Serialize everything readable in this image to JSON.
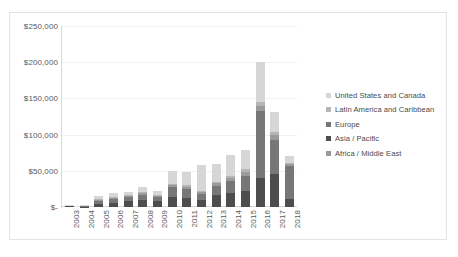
{
  "chart_data": {
    "type": "bar",
    "stacked": true,
    "title": "",
    "xlabel": "",
    "ylabel": "",
    "ylim": [
      0,
      250000
    ],
    "ytick_values": [
      0,
      50000,
      100000,
      150000,
      200000,
      250000
    ],
    "ytick_labels": [
      "$-",
      "$50,000",
      "$100,000",
      "$150,000",
      "$200,000",
      "$250,000"
    ],
    "grid": true,
    "legend_position": "right",
    "categories": [
      "2003",
      "2004",
      "2005",
      "2006",
      "2007",
      "2008",
      "2009",
      "2010",
      "2011",
      "2012",
      "2013",
      "2014",
      "2015",
      "2016",
      "2017",
      "2018"
    ],
    "series": [
      {
        "name": "Asia / Pacific",
        "color": "#4d4d4d",
        "values": [
          1000,
          500,
          4000,
          6000,
          8000,
          9000,
          8000,
          14000,
          13000,
          9000,
          16000,
          19000,
          22000,
          40000,
          46000,
          11000
        ]
      },
      {
        "name": "Europe",
        "color": "#777777",
        "values": [
          600,
          700,
          4000,
          5000,
          5500,
          8000,
          6000,
          13000,
          12000,
          9000,
          13000,
          17000,
          21000,
          92000,
          47000,
          45000
        ]
      },
      {
        "name": "Africa / Middle East",
        "color": "#9a9a9a",
        "values": [
          300,
          400,
          1500,
          1800,
          1500,
          2000,
          1500,
          3500,
          3000,
          2500,
          3500,
          4500,
          5500,
          8000,
          6000,
          3000
        ]
      },
      {
        "name": "Latin America and Caribbean",
        "color": "#b5b5b5",
        "values": [
          200,
          300,
          1000,
          1200,
          1000,
          1200,
          1000,
          2000,
          2000,
          2000,
          2500,
          3000,
          3500,
          5000,
          4000,
          2000
        ]
      },
      {
        "name": "United States and Canada",
        "color": "#d6d6d6",
        "values": [
          400,
          600,
          4500,
          6000,
          5000,
          8000,
          6000,
          17000,
          19000,
          36000,
          24000,
          29000,
          27000,
          55000,
          28000,
          10000
        ]
      }
    ]
  },
  "legend": {
    "items": [
      {
        "label": "United States and Canada",
        "color": "#d6d6d6"
      },
      {
        "label": "Latin America and Caribbean",
        "color": "#b5b5b5"
      },
      {
        "label": "Europe",
        "color": "#777777"
      },
      {
        "label": "Asia / Pacific",
        "color": "#4d4d4d"
      },
      {
        "label": "Africa / Middle East",
        "color": "#9a9a9a"
      }
    ]
  },
  "style": {
    "background": "#ffffff",
    "border_color": "#e3e3e3",
    "gridline_color": "#f2f2f2",
    "axis_color": "#d9d9d9",
    "tick_text_color": "#5a5a5a"
  }
}
